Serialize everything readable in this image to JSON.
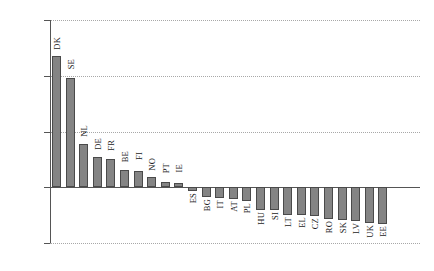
{
  "chart_data": {
    "type": "bar",
    "title": "",
    "xlabel": "",
    "ylabel": "Deviation from mean",
    "ylim": [
      -0.5,
      1.5
    ],
    "yticks": [
      "1.50",
      "1.00",
      "0.50",
      "0.00",
      "-0.50"
    ],
    "ytick_values": [
      1.5,
      1.0,
      0.5,
      0.0,
      -0.5
    ],
    "grid": true,
    "grid_style": "dotted-horizontal",
    "legend": "none",
    "bar_color": "#848484",
    "bar_edge_color": "#4a4a4a",
    "categories": [
      "DK",
      "SE",
      "NL",
      "DE",
      "FR",
      "BE",
      "FI",
      "NO",
      "PT",
      "IE",
      "ES",
      "BG",
      "IT",
      "AT",
      "PL",
      "HU",
      "SI",
      "LT",
      "EL",
      "CZ",
      "RO",
      "SK",
      "LV",
      "UK",
      "EE"
    ],
    "values": [
      1.18,
      0.98,
      0.39,
      0.27,
      0.25,
      0.155,
      0.15,
      0.095,
      0.045,
      0.04,
      -0.035,
      -0.085,
      -0.1,
      -0.105,
      -0.12,
      -0.205,
      -0.205,
      -0.245,
      -0.25,
      -0.26,
      -0.285,
      -0.295,
      -0.3,
      -0.325,
      -0.33
    ]
  }
}
